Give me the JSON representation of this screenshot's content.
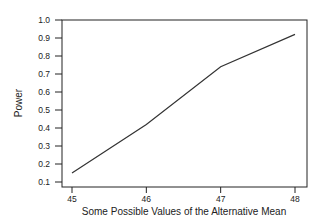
{
  "chart_data": {
    "type": "line",
    "title": "",
    "xlabel": "Some Possible Values of the Alternative Mean",
    "ylabel": "Power",
    "x": [
      45,
      46,
      47,
      48
    ],
    "series": [
      {
        "name": "Power",
        "values": [
          0.15,
          0.42,
          0.74,
          0.92
        ]
      }
    ],
    "xticks": [
      "45",
      "46",
      "47",
      "48"
    ],
    "yticks": [
      "0.1",
      "0.2",
      "0.3",
      "0.4",
      "0.5",
      "0.6",
      "0.7",
      "0.8",
      "0.9",
      "1.0"
    ],
    "xlim": [
      44.85,
      48.2
    ],
    "ylim": [
      0.1,
      1.0
    ],
    "grid": false,
    "legend": "none",
    "colors": {
      "line": "#333333",
      "axis": "#222222"
    }
  }
}
